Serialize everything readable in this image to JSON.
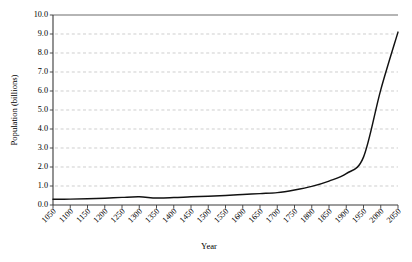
{
  "chart_data": {
    "type": "line",
    "title": "",
    "xlabel": "Year",
    "ylabel": "Population (billions)",
    "xlim": [
      1050,
      2050
    ],
    "ylim": [
      0.0,
      10.0
    ],
    "grid": true,
    "legend": false,
    "legend_position": "none",
    "line_color": "#111111",
    "grid_color": "#b9b9b9",
    "axis_color": "#3a3a3a",
    "ytick_labels": [
      "0.0",
      "1.0",
      "2.0",
      "3.0",
      "4.0",
      "5.0",
      "6.0",
      "7.0",
      "8.0",
      "9.0",
      "10.0"
    ],
    "ytick_values": [
      0.0,
      1.0,
      2.0,
      3.0,
      4.0,
      5.0,
      6.0,
      7.0,
      8.0,
      9.0,
      10.0
    ],
    "xtick_labels": [
      "1050",
      "1100",
      "1150",
      "1200",
      "1250",
      "1300",
      "1350",
      "1400",
      "1450",
      "1500",
      "1550",
      "1600",
      "1650",
      "1700",
      "1750",
      "1800",
      "1850",
      "1900",
      "1950",
      "2000",
      "2050"
    ],
    "xtick_values": [
      1050,
      1100,
      1150,
      1200,
      1250,
      1300,
      1350,
      1400,
      1450,
      1500,
      1550,
      1600,
      1650,
      1700,
      1750,
      1800,
      1850,
      1900,
      1950,
      2000,
      2050
    ],
    "x": [
      1050,
      1100,
      1150,
      1200,
      1250,
      1300,
      1350,
      1400,
      1450,
      1500,
      1550,
      1600,
      1650,
      1700,
      1750,
      1800,
      1850,
      1900,
      1950,
      2000,
      2050
    ],
    "values": [
      0.3,
      0.31,
      0.33,
      0.36,
      0.4,
      0.43,
      0.37,
      0.39,
      0.43,
      0.46,
      0.5,
      0.55,
      0.6,
      0.65,
      0.79,
      0.98,
      1.26,
      1.65,
      2.52,
      6.06,
      9.1
    ],
    "series": [
      {
        "name": "World population",
        "values": [
          0.3,
          0.31,
          0.33,
          0.36,
          0.4,
          0.43,
          0.37,
          0.39,
          0.43,
          0.46,
          0.5,
          0.55,
          0.6,
          0.65,
          0.79,
          0.98,
          1.26,
          1.65,
          2.52,
          6.06,
          9.1
        ]
      }
    ]
  }
}
